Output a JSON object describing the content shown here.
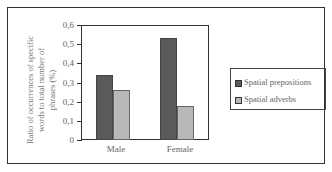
{
  "chart_data": {
    "type": "bar",
    "title": "",
    "categories": [
      "Male",
      "Female"
    ],
    "series": [
      {
        "name": "Spatial prepositions",
        "values": [
          0.34,
          0.53
        ],
        "color": "#5a5a5a"
      },
      {
        "name": "Spatial adverbs",
        "values": [
          0.26,
          0.18
        ],
        "color": "#b8b8b8"
      }
    ],
    "xlabel": "",
    "ylabel": "Ratio of occurrences of specific words to total number of phrases (%)",
    "ylim": [
      0,
      0.6
    ],
    "yticks": [
      "0",
      "0,1",
      "0,2",
      "0,3",
      "0,4",
      "0,5",
      "0,6"
    ],
    "grid": false,
    "legend_position": "right"
  }
}
